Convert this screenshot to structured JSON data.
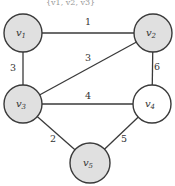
{
  "caption": "{v1, v2, v3}",
  "colors": {
    "highlighted_fill": "#e0e0e0",
    "normal_fill": "#ffffff",
    "stroke": "#3a3a3a"
  },
  "nodes": [
    {
      "id": "v1",
      "base": "v",
      "sub": "1",
      "x": 23,
      "y": 33,
      "r": 19,
      "highlighted": true
    },
    {
      "id": "v2",
      "base": "v",
      "sub": "2",
      "x": 153,
      "y": 33,
      "r": 19,
      "highlighted": true
    },
    {
      "id": "v3",
      "base": "v",
      "sub": "3",
      "x": 23,
      "y": 104,
      "r": 19,
      "highlighted": true
    },
    {
      "id": "v4",
      "base": "v",
      "sub": "4",
      "x": 152,
      "y": 104,
      "r": 19,
      "highlighted": false
    },
    {
      "id": "v5",
      "base": "v",
      "sub": "5",
      "x": 90,
      "y": 163,
      "r": 20,
      "highlighted": true
    }
  ],
  "edges": [
    {
      "from": "v1",
      "to": "v2",
      "weight": "1",
      "lx": 88,
      "ly": 25
    },
    {
      "from": "v1",
      "to": "v3",
      "weight": "3",
      "lx": 13,
      "ly": 71
    },
    {
      "from": "v3",
      "to": "v2",
      "weight": "3",
      "lx": 88,
      "ly": 61
    },
    {
      "from": "v3",
      "to": "v4",
      "weight": "4",
      "lx": 88,
      "ly": 99
    },
    {
      "from": "v2",
      "to": "v4",
      "weight": "6",
      "lx": 157,
      "ly": 70
    },
    {
      "from": "v3",
      "to": "v5",
      "weight": "2",
      "lx": 53,
      "ly": 142
    },
    {
      "from": "v4",
      "to": "v5",
      "weight": "5",
      "lx": 124,
      "ly": 142
    }
  ]
}
